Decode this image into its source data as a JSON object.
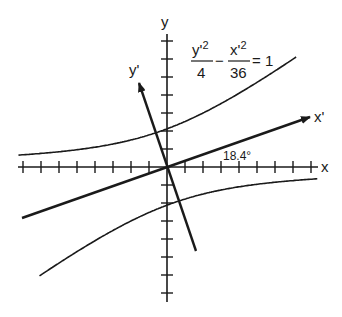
{
  "figure": {
    "equation": {
      "left_numerator": "y'",
      "left_numerator_exp": "2",
      "left_denominator": "4",
      "operator": "−",
      "right_numerator": "x'",
      "right_numerator_exp": "2",
      "right_denominator": "36",
      "equals": "= 1"
    },
    "axes": {
      "x_label": "x",
      "y_label": "y",
      "x_prime_label": "x'",
      "y_prime_label": "y'"
    },
    "rotation_angle_label": "18.4°",
    "rotation_angle_deg": 18.4,
    "hyperbola": {
      "a_squared": 4,
      "b_squared": 36,
      "transverse_axis": "y'"
    },
    "colors": {
      "ink": "#1a1a1a",
      "background": "#ffffff"
    },
    "geometry": {
      "origin": [
        167,
        167
      ],
      "unit_px": 18,
      "x_axis": {
        "from": 18,
        "to": 318,
        "ticks_left": 8,
        "ticks_right": 8
      },
      "y_axis": {
        "from": 34,
        "to": 302,
        "ticks_up": 7,
        "ticks_down": 7
      }
    }
  }
}
